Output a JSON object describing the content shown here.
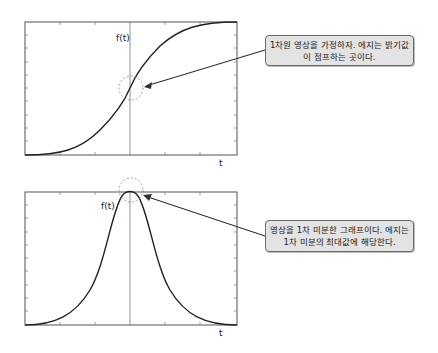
{
  "top_plot": {
    "y_label": "f(t)",
    "x_label": "t",
    "curve": "sigmoid",
    "callout": "1차원 영상을 가정하자. 에지는 밝기값이 점프하는 곳이다."
  },
  "bottom_plot": {
    "y_label": "f(t)",
    "x_label": "t",
    "curve": "bell",
    "callout": "영상을 1차 미분한 그래프이다. 에지는 1차 미분의 최대값에 해당한다."
  },
  "colors": {
    "curve": "#222222",
    "frame": "#555555",
    "callout_bg": "#e3e3e3"
  }
}
